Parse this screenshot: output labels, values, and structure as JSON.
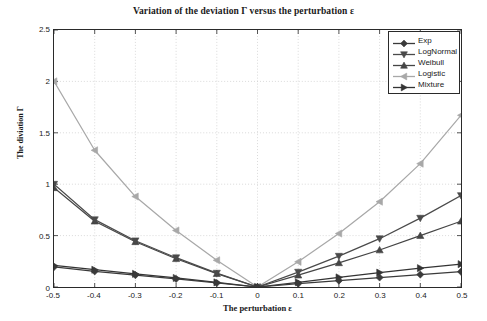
{
  "chart_data": {
    "type": "line",
    "title": "Variation of the deviation Γ versus the perturbation ε",
    "xlabel": "The perturbation ε",
    "ylabel": "The diviation Γ",
    "xlim": [
      -0.5,
      0.5
    ],
    "ylim": [
      0,
      2.5
    ],
    "xticks": [
      -0.5,
      -0.4,
      -0.3,
      -0.2,
      -0.1,
      0,
      0.1,
      0.2,
      0.3,
      0.4,
      0.5
    ],
    "xtick_labels": [
      "-0.5",
      "-0.4",
      "-0.3",
      "-0.2",
      "-0.1",
      "0",
      "0.1",
      "0.2",
      "0.3",
      "0.4",
      "0.5"
    ],
    "yticks": [
      0,
      0.5,
      1,
      1.5,
      2,
      2.5
    ],
    "ytick_labels": [
      "0",
      "0.5",
      "1",
      "1.5",
      "2",
      "2.5"
    ],
    "grid": true,
    "grid_style": "dotted",
    "legend_position": "upper right",
    "x": [
      -0.5,
      -0.4,
      -0.3,
      -0.2,
      -0.1,
      0,
      0.1,
      0.2,
      0.3,
      0.4,
      0.5
    ],
    "series": [
      {
        "name": "Exp",
        "marker": "diamond",
        "color": "#3a3a3a",
        "values": [
          0.195,
          0.152,
          0.115,
          0.078,
          0.039,
          0.0,
          0.032,
          0.062,
          0.092,
          0.121,
          0.149
        ]
      },
      {
        "name": "LogNormal",
        "marker": "triangle-down",
        "color": "#4a4a4a",
        "values": [
          1.0,
          0.655,
          0.45,
          0.285,
          0.135,
          0.0,
          0.145,
          0.3,
          0.47,
          0.67,
          0.89
        ]
      },
      {
        "name": "Weibull",
        "marker": "triangle-up",
        "color": "#454545",
        "values": [
          0.965,
          0.64,
          0.44,
          0.275,
          0.13,
          0.0,
          0.115,
          0.235,
          0.36,
          0.5,
          0.64
        ]
      },
      {
        "name": "Logistic",
        "marker": "triangle-left",
        "color": "#a8a8a8",
        "values": [
          2.0,
          1.33,
          0.88,
          0.55,
          0.26,
          0.0,
          0.245,
          0.52,
          0.83,
          1.2,
          1.67
        ]
      },
      {
        "name": "Mixture",
        "marker": "triangle-right",
        "color": "#343434",
        "values": [
          0.21,
          0.168,
          0.128,
          0.088,
          0.045,
          0.0,
          0.046,
          0.093,
          0.14,
          0.183,
          0.222
        ]
      }
    ]
  }
}
